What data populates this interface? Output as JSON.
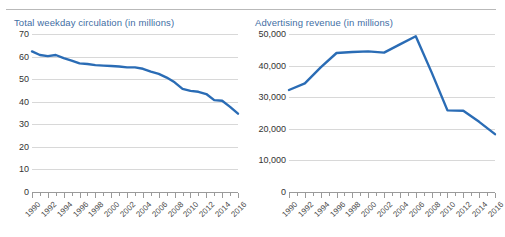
{
  "page": {
    "clipped_header_fragment": "",
    "accent_blue": "#2a6cb5",
    "title_color": "#3f6ea4",
    "grid_color": "#d8d8d8",
    "axis_color": "#9a9a9a"
  },
  "chart_data": [
    {
      "type": "line",
      "title": "Total weekday circulation (in millions)",
      "xlabel": "",
      "ylabel": "",
      "ylim": [
        0,
        70
      ],
      "yticks": [
        0,
        10,
        20,
        30,
        40,
        50,
        60,
        70
      ],
      "ytick_labels": [
        "0",
        "10",
        "20",
        "30",
        "40",
        "50",
        "60",
        "70"
      ],
      "xlim": [
        1990,
        2016
      ],
      "xticks": [
        1990,
        1992,
        1994,
        1996,
        1998,
        2000,
        2002,
        2004,
        2006,
        2008,
        2010,
        2012,
        2014,
        2016
      ],
      "xtick_labels": [
        "1990",
        "1992",
        "1994",
        "1996",
        "1998",
        "2000",
        "2002",
        "2004",
        "2006",
        "2008",
        "2010",
        "2012",
        "2014",
        "2016"
      ],
      "grid": "horizontal",
      "legend": "none",
      "x": [
        1990,
        1991,
        1992,
        1993,
        1994,
        1995,
        1996,
        1997,
        1998,
        1999,
        2000,
        2001,
        2002,
        2003,
        2004,
        2005,
        2006,
        2007,
        2008,
        2009,
        2010,
        2011,
        2012,
        2013,
        2014,
        2015,
        2016
      ],
      "values": [
        62.3,
        60.7,
        60.2,
        60.7,
        59.3,
        58.2,
        57.0,
        56.7,
        56.2,
        56.0,
        55.8,
        55.6,
        55.2,
        55.2,
        54.6,
        53.3,
        52.3,
        50.7,
        48.6,
        45.7,
        44.8,
        44.4,
        43.4,
        40.7,
        40.4,
        37.7,
        34.7
      ],
      "series_name": "Total weekday circulation",
      "series_color": "#2a6cb5",
      "endpoint_values": {
        "first_year": 1990,
        "first_value": 62.3,
        "last_year": 2016,
        "last_value": 34.7,
        "peak_year": 1993,
        "peak_value": 60.7
      }
    },
    {
      "type": "line",
      "title": "Advertising revenue (in millions)",
      "xlabel": "",
      "ylabel": "",
      "ylim": [
        0,
        50000
      ],
      "yticks": [
        0,
        10000,
        20000,
        30000,
        40000,
        50000
      ],
      "ytick_labels": [
        "0",
        "10,000",
        "20,000",
        "30,000",
        "40,000",
        "50,000"
      ],
      "xlim": [
        1990,
        2016
      ],
      "xticks": [
        1990,
        1992,
        1994,
        1996,
        1998,
        2000,
        2002,
        2004,
        2006,
        2008,
        2010,
        2012,
        2014,
        2016
      ],
      "xtick_labels": [
        "1990",
        "1992",
        "1994",
        "1996",
        "1998",
        "2000",
        "2002",
        "2004",
        "2006",
        "2008",
        "2010",
        "2012",
        "2014",
        "2016"
      ],
      "grid": "horizontal",
      "legend": "none",
      "x": [
        1990,
        1992,
        1994,
        1996,
        1998,
        2000,
        2002,
        2004,
        2006,
        2008,
        2010,
        2012,
        2014,
        2016
      ],
      "values": [
        32280,
        34360,
        39420,
        43990,
        44300,
        44500,
        44100,
        46700,
        49280,
        37850,
        25840,
        25730,
        22200,
        18300
      ],
      "series_name": "Advertising revenue",
      "series_color": "#2a6cb5",
      "endpoint_values": {
        "first_year": 1990,
        "first_value": 32280,
        "last_year": 2016,
        "last_value": 18300,
        "peak_year": 2006,
        "peak_value": 49280
      }
    }
  ]
}
